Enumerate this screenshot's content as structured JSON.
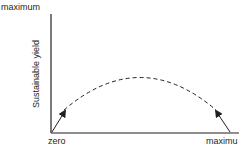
{
  "diagram": {
    "y_axis": {
      "label": "Sustainable yield",
      "top_label": "maximum"
    },
    "x_axis": {
      "left_label": "zero",
      "right_label": "maximu"
    },
    "curve": {
      "style": "dashed",
      "shape": "inverted-parabola"
    },
    "arrows": [
      {
        "position": "left",
        "direction": "up-right"
      },
      {
        "position": "right",
        "direction": "up-left"
      }
    ],
    "colors": {
      "ink": "#231f20",
      "background": "#ffffff"
    }
  }
}
